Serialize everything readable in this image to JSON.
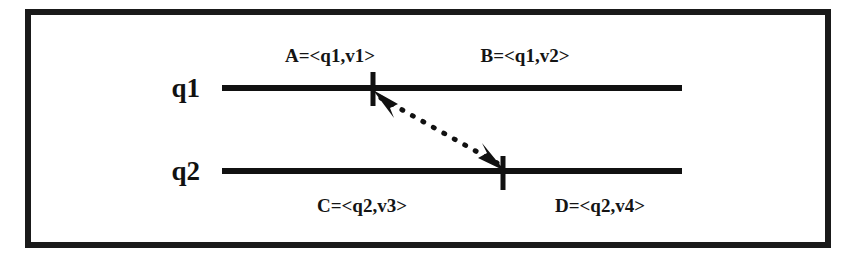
{
  "figure": {
    "background_color": "#ffffff",
    "ink_color": "#111111",
    "border": {
      "name": "outer-frame",
      "x": 28,
      "y": 12,
      "width": 800,
      "height": 233,
      "stroke_width": 6,
      "color": "#1a1a1a"
    }
  },
  "timelines": [
    {
      "id": "q1",
      "label": "q1",
      "label_x": 200,
      "label_y": 97,
      "line": {
        "x1": 222,
        "x2": 682,
        "y": 88,
        "stroke_width": 6
      },
      "tick": {
        "name": "tick-q1",
        "x": 373,
        "y_top": 72,
        "y_bottom": 106,
        "stroke_width": 5
      }
    },
    {
      "id": "q2",
      "label": "q2",
      "label_x": 200,
      "label_y": 180,
      "line": {
        "x1": 222,
        "x2": 682,
        "y": 171,
        "stroke_width": 6
      },
      "tick": {
        "name": "tick-q2",
        "x": 503,
        "y_top": 156,
        "y_bottom": 190,
        "stroke_width": 5
      }
    }
  ],
  "interval_labels": [
    {
      "id": "A",
      "text": "A=<q1,v1>",
      "x": 330,
      "y": 62,
      "anchor": "middle",
      "timeline": "q1",
      "position": "left-of-tick"
    },
    {
      "id": "B",
      "text": "B=<q1,v2>",
      "x": 525,
      "y": 62,
      "anchor": "middle",
      "timeline": "q1",
      "position": "right-of-tick"
    },
    {
      "id": "C",
      "text": "C=<q2,v3>",
      "x": 362,
      "y": 212,
      "anchor": "middle",
      "timeline": "q2",
      "position": "left-of-tick"
    },
    {
      "id": "D",
      "text": "D=<q2,v4>",
      "x": 600,
      "y": 212,
      "anchor": "middle",
      "timeline": "q2",
      "position": "right-of-tick"
    }
  ],
  "connector": {
    "name": "dotted-double-arrow",
    "style": "dotted",
    "bidirectional": true,
    "stroke_width": 5,
    "dash_pattern": "1 11",
    "from_x": 381,
    "from_y": 98,
    "to_x": 497,
    "to_y": 163,
    "arrowhead_upper": {
      "name": "arrowhead-toward-q1",
      "points": "373,90 398,104 390,108 394,118"
    },
    "arrowhead_lower": {
      "name": "arrowhead-toward-q2",
      "points": "505,171 478,158 487,153 482,143"
    }
  }
}
